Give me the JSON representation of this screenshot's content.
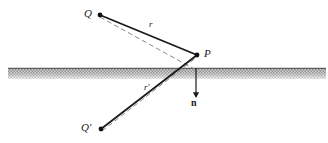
{
  "figure": {
    "kind": "geometric-optics-reflection-diagram",
    "background_color": "#ffffff",
    "ink_color": "#1a1a1a",
    "surface": {
      "name": "hatched-interface-band",
      "fill_color": "#b5b5b5",
      "edge_color": "#6b6b6b",
      "x_start": 8,
      "x_end": 326,
      "y_top": 68,
      "y_bottom": 79
    },
    "points": [
      {
        "id": "Q",
        "label": "Q",
        "x": 100,
        "y": 15,
        "label_x": 84,
        "label_y": 8,
        "dot_r": 2.4
      },
      {
        "id": "P",
        "label": "P",
        "x": 197,
        "y": 55,
        "label_x": 204,
        "label_y": 48,
        "dot_r": 2.4
      },
      {
        "id": "Qprime",
        "label": "Q'",
        "x": 101,
        "y": 129,
        "label_x": 81,
        "label_y": 122,
        "dot_r": 2.4
      }
    ],
    "solid_rays": [
      {
        "id": "ray-Q-to-P",
        "from": "Q",
        "to": "P",
        "x1": 100,
        "y1": 15,
        "x2": 197,
        "y2": 55,
        "width": 1.8
      },
      {
        "id": "ray-Qprime-to-P",
        "from": "Qprime",
        "to": "P",
        "x1": 101,
        "y1": 129,
        "x2": 197,
        "y2": 55,
        "width": 1.8
      }
    ],
    "dashed_rays": [
      {
        "id": "dashed-Q-to-foot",
        "from": "Q",
        "x1": 100,
        "y1": 17,
        "x2": 196,
        "y2": 70,
        "width": 1.0,
        "dash": "5 3"
      },
      {
        "id": "dashed-Qprime-to-foot",
        "from": "Qprime",
        "x1": 102,
        "y1": 131,
        "x2": 197,
        "y2": 57,
        "width": 1.0,
        "dash": "5 3"
      }
    ],
    "normal_vector": {
      "id": "normal-n",
      "label": "n",
      "x1": 196,
      "y1": 68,
      "x2": 196,
      "y2": 95,
      "width": 1.2,
      "label_x": 191,
      "label_y": 98
    },
    "segment_labels": [
      {
        "id": "label-r",
        "text": "r",
        "x": 149,
        "y": 20
      },
      {
        "id": "label-rprime",
        "text": "r'",
        "x": 144,
        "y": 83
      }
    ]
  }
}
